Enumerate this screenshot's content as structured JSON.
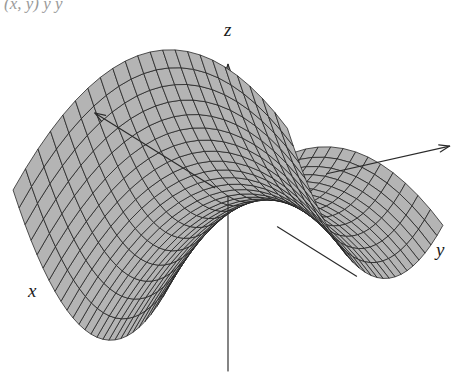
{
  "figure": {
    "kind": "3d-surface-plot",
    "background_color": "#ffffff",
    "caption_fragment": "(x, y)      y        y",
    "surface": {
      "name": "saddle-surface",
      "equation": "z = x^2 - y^2",
      "type": "hyperbolic-paraboloid",
      "fill_color": "#b4b4b4",
      "line_color": "#1e1e1e",
      "mesh_u_divisions": 26,
      "mesh_v_divisions": 22,
      "u_range": [
        -1.18,
        1.18
      ],
      "v_range": [
        -1.25,
        1.25
      ]
    },
    "axes": [
      {
        "name": "x",
        "label": "x",
        "label_x": 28,
        "label_y": 297,
        "direction": "down-left",
        "color": "#2a2a2a"
      },
      {
        "name": "y",
        "label": "y",
        "label_x": 436,
        "label_y": 256,
        "direction": "right",
        "color": "#2a2a2a"
      },
      {
        "name": "z",
        "label": "z",
        "label_x": 224,
        "label_y": 36,
        "direction": "up",
        "color": "#2a2a2a"
      }
    ],
    "projection": {
      "origin_x": 228,
      "origin_y": 196,
      "scale": 128,
      "z_scale": 74,
      "azimuth_deg": 31,
      "elevation_deg": 22
    }
  }
}
